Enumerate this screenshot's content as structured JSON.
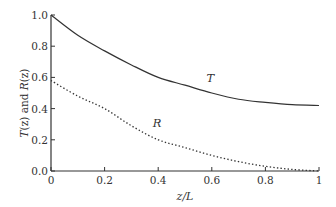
{
  "chart_data": {
    "type": "line",
    "title": "",
    "xlabel": "z/L",
    "ylabel": "T(z) and R(z)",
    "xlim": [
      0,
      1
    ],
    "ylim": [
      0,
      1.0
    ],
    "grid": false,
    "legend": "inline curve labels",
    "x_ticks": [
      "0",
      "0.2",
      "0.4",
      "0.6",
      "0.8",
      "1"
    ],
    "y_ticks": [
      "0.0",
      "0.2",
      "0.4",
      "0.6",
      "0.8",
      "1.0"
    ],
    "x": [
      0,
      0.1,
      0.2,
      0.3,
      0.4,
      0.5,
      0.6,
      0.7,
      0.8,
      0.9,
      1.0
    ],
    "series": [
      {
        "name": "T",
        "style": "solid",
        "values": [
          1.0,
          0.87,
          0.77,
          0.68,
          0.6,
          0.55,
          0.5,
          0.46,
          0.44,
          0.425,
          0.42
        ]
      },
      {
        "name": "R",
        "style": "dotted",
        "values": [
          0.58,
          0.48,
          0.4,
          0.29,
          0.2,
          0.15,
          0.1,
          0.06,
          0.03,
          0.01,
          0.0
        ]
      }
    ],
    "annotations": [
      {
        "text": "T",
        "x": 0.58,
        "y": 0.57
      },
      {
        "text": "R",
        "x": 0.38,
        "y": 0.28
      }
    ]
  },
  "axes": {
    "xlabel_main": "z/L",
    "ylabel_parts": {
      "t": "T",
      "z1": "(z) and ",
      "r": "R",
      "z2": "(z)"
    }
  },
  "colors": {
    "line": "#333333",
    "axis": "#333333",
    "background": "#ffffff"
  }
}
